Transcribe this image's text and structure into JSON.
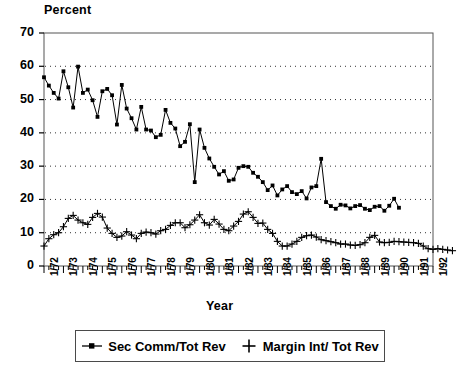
{
  "chart_data": {
    "type": "line",
    "title": "",
    "ylabel": "Percent",
    "xlabel": "Year",
    "ylim": [
      0,
      70
    ],
    "yticks": [
      0,
      10,
      20,
      30,
      40,
      50,
      60,
      70
    ],
    "grid": "horizontal-dotted",
    "legend_position": "below-plot",
    "x_tick_labels": [
      "1/72",
      "1/73",
      "1/74",
      "1/75",
      "1/76",
      "1/77",
      "1/78",
      "1/79",
      "1/80",
      "1/81",
      "1/82",
      "1/83",
      "1/84",
      "1/85",
      "1/86",
      "1/87",
      "1/88",
      "1/89",
      "1/90",
      "1/91",
      "1/92"
    ],
    "x_start": "1/72",
    "x_end": "1/92",
    "x_frequency": "quarterly",
    "series": [
      {
        "name": "Sec Comm/Tot Rev",
        "marker": "filled-square",
        "color": "#000000",
        "values": [
          56.7,
          54.2,
          52.0,
          50.3,
          58.5,
          53.7,
          47.6,
          59.9,
          52.0,
          53.0,
          49.8,
          44.8,
          52.5,
          53.2,
          51.3,
          42.5,
          54.4,
          47.3,
          44.4,
          41.0,
          47.8,
          41.0,
          40.7,
          38.7,
          39.4,
          46.9,
          43.0,
          41.3,
          36.0,
          37.3,
          42.6,
          25.2,
          41.0,
          35.5,
          32.3,
          29.8,
          27.5,
          28.5,
          25.6,
          26.0,
          29.5,
          30.0,
          29.8,
          28.0,
          26.8,
          25.2,
          22.8,
          24.2,
          21.2,
          23.0,
          24.0,
          22.2,
          21.6,
          22.5,
          20.3,
          23.6,
          24.0,
          32.2,
          19.2,
          18.0,
          17.2,
          18.4,
          18.2,
          17.3,
          18.0,
          18.3,
          17.2,
          16.8,
          17.8,
          18.0,
          16.6,
          18.1,
          20.2,
          17.5
        ]
      },
      {
        "name": "Margin Int/ Tot Rev",
        "marker": "plus",
        "color": "#000000",
        "values": [
          6.0,
          8.2,
          9.4,
          10.0,
          11.8,
          14.3,
          15.2,
          13.8,
          13.0,
          12.5,
          14.6,
          15.8,
          14.7,
          11.4,
          9.8,
          8.6,
          9.0,
          10.3,
          9.3,
          8.2,
          9.8,
          10.2,
          10.0,
          9.6,
          10.6,
          11.0,
          12.2,
          13.0,
          13.0,
          11.5,
          12.4,
          13.8,
          15.4,
          13.0,
          12.3,
          14.0,
          12.6,
          11.0,
          10.6,
          12.0,
          13.4,
          15.6,
          16.3,
          14.6,
          12.8,
          12.9,
          11.0,
          9.8,
          7.4,
          6.0,
          6.0,
          6.6,
          7.4,
          8.6,
          9.1,
          9.3,
          8.7,
          7.9,
          7.6,
          7.3,
          7.0,
          6.6,
          6.6,
          6.3,
          6.2,
          6.4,
          7.0,
          8.6,
          9.2,
          7.2,
          7.0,
          7.1,
          7.4,
          7.3,
          7.2,
          7.1,
          7.0,
          6.8,
          6.0,
          5.2,
          5.0,
          5.2,
          5.0,
          4.8,
          4.6
        ]
      }
    ]
  },
  "legend": {
    "items": [
      {
        "label": "Sec Comm/Tot Rev",
        "marker": "filled-square"
      },
      {
        "label": "Margin Int/ Tot Rev",
        "marker": "plus"
      }
    ]
  }
}
